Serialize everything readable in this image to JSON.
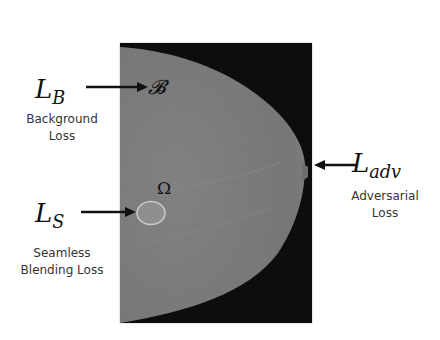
{
  "figure": {
    "panel": {
      "description": "mammogram",
      "colors": {
        "background": "#0d0d0d",
        "tissue": "#7d7d7d",
        "region_outline": "#c8c8c8"
      }
    },
    "labels": {
      "background": {
        "symbol_main": "L",
        "symbol_sub": "B",
        "target_symbol": "𝓑",
        "caption_line1": "Background",
        "caption_line2": "Loss"
      },
      "seamless": {
        "symbol_main": "L",
        "symbol_sub": "S",
        "target_symbol": "Ω",
        "caption_line1": "Seamless",
        "caption_line2": "Blending Loss"
      },
      "adversarial": {
        "symbol_main": "L",
        "symbol_sub": "adv",
        "caption_line1": "Adversarial",
        "caption_line2": "Loss"
      }
    },
    "arrow_color": "#111111"
  }
}
